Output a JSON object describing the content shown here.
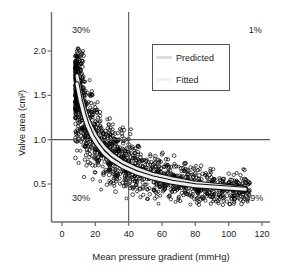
{
  "chart_data": {
    "type": "scatter",
    "title": "",
    "xlabel": "Mean pressure gradient (mmHg)",
    "ylabel": "Valve area (cm²)",
    "xlim": [
      -3,
      128
    ],
    "ylim": [
      0.22,
      2.28
    ],
    "xticks": [
      0,
      20,
      40,
      60,
      80,
      100,
      120
    ],
    "xtick_labels": [
      "0",
      "20",
      "40",
      "60",
      "80",
      "100",
      "120"
    ],
    "yticks": [
      0.5,
      1.0,
      1.5,
      2.0
    ],
    "ytick_labels": [
      "0.5",
      "1.0",
      "1.5",
      "2.0"
    ],
    "grid": false,
    "legend_position": "upper-center-right",
    "marker": "open-circle",
    "marker_color": "#000000",
    "point_count": 1500,
    "reference_lines": [
      {
        "name": "vertical-threshold",
        "orientation": "vertical",
        "value": 40,
        "color": "#555555"
      },
      {
        "name": "horizontal-threshold",
        "orientation": "horizontal",
        "value": 1.0,
        "color": "#555555"
      }
    ],
    "quadrant_annotations": [
      {
        "name": "top-left",
        "text": "30%",
        "x": 6,
        "y": 2.22
      },
      {
        "name": "top-right",
        "text": "1%",
        "x": 112,
        "y": 2.22
      },
      {
        "name": "bottom-left",
        "text": "30%",
        "x": 6,
        "y": 0.33
      },
      {
        "name": "bottom-right",
        "text": "39%",
        "x": 110,
        "y": 0.33
      }
    ],
    "series": [
      {
        "name": "Predicted",
        "type": "line",
        "color": "#e8e8e8",
        "outline_color": "#111111",
        "x": [
          9,
          11,
          13,
          15,
          18,
          21,
          25,
          30,
          36,
          44,
          54,
          66,
          80,
          95,
          110
        ],
        "y": [
          1.72,
          1.52,
          1.37,
          1.25,
          1.12,
          1.02,
          0.92,
          0.83,
          0.75,
          0.68,
          0.61,
          0.56,
          0.51,
          0.48,
          0.45
        ]
      },
      {
        "name": "Fitted",
        "type": "line",
        "color": "#f2f2f2",
        "outline_color": "#111111",
        "x": [
          9,
          11,
          13,
          15,
          18,
          21,
          25,
          30,
          36,
          44,
          54,
          66,
          80,
          95,
          110
        ],
        "y": [
          1.63,
          1.44,
          1.29,
          1.17,
          1.04,
          0.95,
          0.85,
          0.77,
          0.7,
          0.63,
          0.57,
          0.52,
          0.48,
          0.46,
          0.44
        ]
      }
    ],
    "legend_entries": [
      {
        "label": "Predicted",
        "color": "#dcdcdc"
      },
      {
        "label": "Fitted",
        "color": "#f0f0f0"
      }
    ]
  },
  "axes": {
    "spine_color": "#6b6b6b",
    "tick_color": "#6b6b6b",
    "text_color": "#1a1a1a"
  }
}
